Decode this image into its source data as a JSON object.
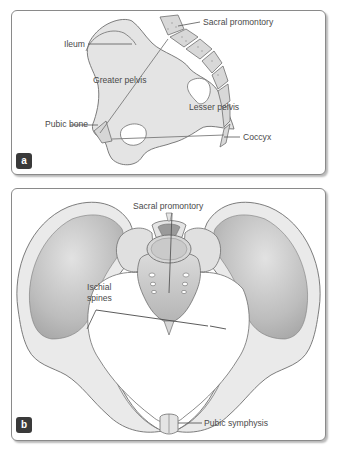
{
  "figure": {
    "panels": [
      {
        "id": "a",
        "badge": "a",
        "view": "lateral-section",
        "labels": {
          "sacral_promontory": "Sacral promontory",
          "ileum": "Ileum",
          "greater_pelvis": "Greater pelvis",
          "lesser_pelvis": "Lesser pelvis",
          "pubic_bone": "Pubic bone",
          "coccyx": "Coccyx"
        }
      },
      {
        "id": "b",
        "badge": "b",
        "view": "superior-view",
        "labels": {
          "sacral_promontory": "Sacral promontory",
          "ischial_spines_line1": "Ischial",
          "ischial_spines_line2": "spines",
          "pubic_symphysis": "Pubic symphysis"
        }
      }
    ],
    "colors": {
      "bone_fill": "#e4e4e4",
      "bone_shadow": "#b8b8b8",
      "outline": "#6e6e6e",
      "label_text": "#4a4a4a",
      "badge_bg": "#3a3a3a",
      "panel_border": "#8a8a8a"
    }
  }
}
